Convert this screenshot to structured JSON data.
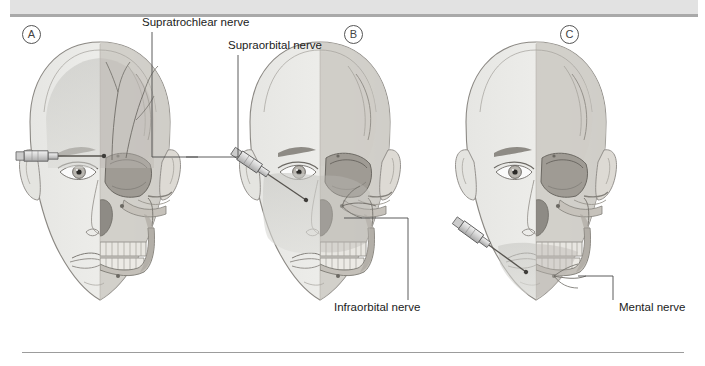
{
  "figure": {
    "background_color": "#ffffff",
    "top_band_color": "#e2e2e2",
    "rule_color": "#a9a9a9",
    "panels": [
      {
        "id": "A",
        "letter": "A",
        "letter_x": 28,
        "letter_y": 27,
        "head_cx": 130,
        "head_cy": 200,
        "injection_site": "forehead",
        "syringe_angle": "horizontal",
        "shaded_region": "forehead",
        "labels": [
          {
            "text": "Supratrochlear nerve",
            "x": 142,
            "y": 18,
            "leader_from_x": 152,
            "leader_from_y": 32,
            "leader_to_x": 152,
            "leader_to_y": 157,
            "leader_end_x": 198,
            "leader_end_y": 157
          },
          {
            "text": "Supraorbital nerve",
            "x": 228,
            "y": 41,
            "leader_from_x": 238,
            "leader_from_y": 55,
            "leader_to_x": 238,
            "leader_to_y": 157,
            "leader_end_x": 186,
            "leader_end_y": 157
          }
        ]
      },
      {
        "id": "B",
        "letter": "B",
        "letter_x": 350,
        "letter_y": 27,
        "head_cx": 350,
        "head_cy": 200,
        "injection_site": "cheek",
        "syringe_angle": "diagonal-up-right",
        "shaded_region": "midface",
        "labels": [
          {
            "text": "Infraorbital nerve",
            "x": 337,
            "y": 305,
            "leader_from_x": 408,
            "leader_from_y": 300,
            "leader_to_x": 408,
            "leader_to_y": 218,
            "leader_end_x": 344,
            "leader_end_y": 218
          }
        ]
      },
      {
        "id": "C",
        "letter": "C",
        "letter_x": 566,
        "letter_y": 27,
        "head_cx": 566,
        "head_cy": 200,
        "injection_site": "chin",
        "syringe_angle": "diagonal-up-right",
        "shaded_region": "lower-face",
        "labels": [
          {
            "text": "Mental nerve",
            "x": 620,
            "y": 305,
            "leader_from_x": 613,
            "leader_from_y": 300,
            "leader_to_x": 613,
            "leader_to_y": 276,
            "leader_end_x": 578,
            "leader_end_y": 276
          }
        ]
      }
    ],
    "colors": {
      "skin_light": "#ebebe9",
      "skin_shade": "#cfcfcb",
      "bone_light": "#dedad3",
      "bone_mid": "#bdb9b1",
      "bone_dark": "#8e8a83",
      "outline": "#7d7a75",
      "nerve_line": "#6f6c66",
      "leader_line": "#4a4a4a",
      "syringe_body": "#d6d6d6",
      "syringe_outline": "#5d5d5d",
      "label_text": "#1b1b1b"
    }
  }
}
